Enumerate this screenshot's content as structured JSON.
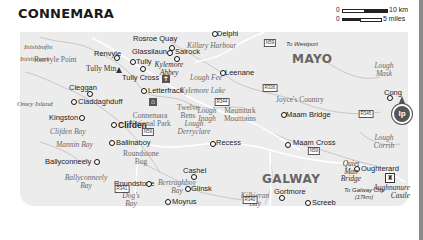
{
  "title": "CONNEMARA",
  "scale": {
    "zero_km": "0",
    "km_label": "10 km",
    "zero_mi": "0",
    "mi_label": "5 miles"
  },
  "regions": {
    "mayo": "MAYO",
    "galway": "GALWAY"
  },
  "towns": {
    "rosroe_quay": "Rosroe Quay",
    "delphi": "Delphi",
    "renvyle": "Renvyle",
    "glassilaun": "Glassilaun",
    "salrock": "Salrock",
    "tully": "Tully",
    "tully_cross": "Tully Cross",
    "leenane": "Leenane",
    "letterfrack": "Letterfrack",
    "cleggan": "Cleggan",
    "claddaghduff": "Claddaghduff",
    "kingston": "Kingston",
    "clifden": "Clifden",
    "ballinaboy": "Ballinaboy",
    "ballyconneely": "Ballyconneely",
    "roundstone": "Roundstone",
    "cashel": "Cashel",
    "glinsk": "Glinsk",
    "moyrus": "Moyrus",
    "recess": "Recess",
    "maam_bridge": "Maam Bridge",
    "maam_cross": "Maam Cross",
    "cong": "Cong",
    "oughterard": "Oughterard",
    "gortmore": "Gortmore",
    "screeb": "Screeb"
  },
  "islands": {
    "inishbofin": "Inishbofin",
    "inishshark": "Inishshark",
    "omey_island": "Omey Island"
  },
  "water": {
    "killary_harbour": "Killary Harbour",
    "lough_fee": "Lough Fee",
    "kylemore_lake": "Kylemore Lake",
    "lough_mask": "Lough Mask",
    "clifden_bay": "Clifden Bay",
    "mannin_bay": "Mannin Bay",
    "ballyconneely_bay": "Ballyconneely Bay",
    "dogs_bay": "Dog's Bay",
    "bertraghboy_bay": "Bertraghboy Bay",
    "lough_inagh": "Lough Inagh",
    "lough_derryclare": "Lough Derryclare",
    "lough_corrib": "Lough Corrib",
    "kilkieran_bay": "Kilkieran Bay"
  },
  "terrain": {
    "renvyle_point": "Renvyle Point",
    "tully_mtn": "Tully Mtn",
    "connemara_np": "Connemara National Park",
    "twelve_bens": "Twelve Bens",
    "maumturk_mountains": "Maumturk Mountains",
    "joyces_country": "Joyce's Country",
    "roundstone_bog": "Roundstone Bog"
  },
  "sights": {
    "kylemore_abbey": "Kylemore Abbey",
    "quiet_man_bridge": "Quiet Man Bridge",
    "aughnanure_castle": "Aughnanure Castle"
  },
  "roads": {
    "n59_north": "N59",
    "r336": "R336",
    "r344": "R344",
    "r345": "R345",
    "n59_clifden": "N59",
    "n59_maam": "N59",
    "r341": "R341",
    "r340": "R340"
  },
  "directions": {
    "to_westport": "To Westport",
    "to_galway_city": "To Galway City (17km)"
  },
  "logo": "lp"
}
